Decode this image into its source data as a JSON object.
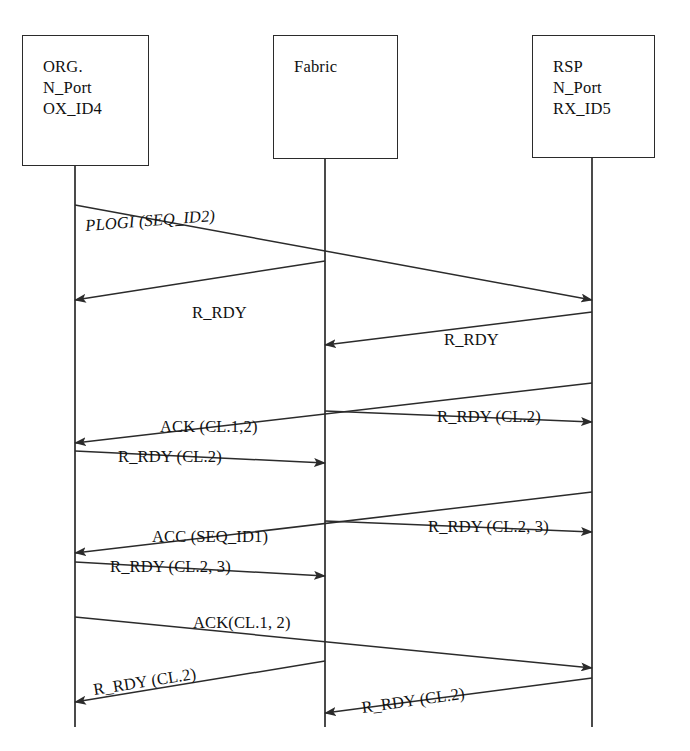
{
  "diagram": {
    "type": "sequence-diagram",
    "width": 690,
    "height": 751,
    "line_color": "#2b2b2b",
    "background_color": "#ffffff"
  },
  "nodes": [
    {
      "id": "org",
      "label": "ORG.\nN_Port\nOX_ID4",
      "lines": [
        "ORG.",
        "N_Port",
        "OX_ID4"
      ],
      "box": {
        "x": 22,
        "y": 35,
        "w": 127,
        "h": 131
      },
      "lifeline_x": 75,
      "lifeline_y1": 166,
      "lifeline_y2": 727
    },
    {
      "id": "fabric",
      "label": "Fabric",
      "lines": [
        "Fabric"
      ],
      "box": {
        "x": 273,
        "y": 35,
        "w": 125,
        "h": 124
      },
      "lifeline_x": 325,
      "lifeline_y1": 159,
      "lifeline_y2": 727
    },
    {
      "id": "rsp",
      "label": "RSP\nN_Port\nRX_ID5",
      "lines": [
        "RSP",
        "N_Port",
        "RX_ID5"
      ],
      "box": {
        "x": 532,
        "y": 35,
        "w": 123,
        "h": 123
      },
      "lifeline_x": 592,
      "lifeline_y1": 158,
      "lifeline_y2": 727
    }
  ],
  "messages": [
    {
      "id": "m1",
      "label": "PLOGI (SEQ_ID2)",
      "italic": true,
      "from": "org",
      "to": "rsp",
      "x1": 75,
      "y1": 205,
      "x2": 592,
      "y2": 300,
      "label_x": 86,
      "label_y": 216,
      "label_rot": -4.5
    },
    {
      "id": "m2",
      "label": "R_RDY",
      "italic": false,
      "from": "fabric",
      "to": "org",
      "x1": 325,
      "y1": 261,
      "x2": 75,
      "y2": 300,
      "label_x": 192,
      "label_y": 303,
      "label_rot": 0
    },
    {
      "id": "m3",
      "label": "R_RDY",
      "italic": false,
      "from": "rsp",
      "to": "fabric",
      "x1": 592,
      "y1": 312,
      "x2": 325,
      "y2": 345,
      "label_x": 444,
      "label_y": 330,
      "label_rot": 0
    },
    {
      "id": "m4",
      "label": "ACK (CL.1,2)",
      "italic": false,
      "from": "rsp",
      "to": "org",
      "x1": 592,
      "y1": 383,
      "x2": 75,
      "y2": 443,
      "label_x": 160,
      "label_y": 417,
      "label_rot": 0
    },
    {
      "id": "m5",
      "label": "R_RDY (CL.2)",
      "italic": false,
      "from": "fabric",
      "to": "rsp",
      "x1": 325,
      "y1": 411,
      "x2": 592,
      "y2": 422,
      "label_x": 437,
      "label_y": 407,
      "label_rot": 0
    },
    {
      "id": "m6",
      "label": "R_RDY (CL.2)",
      "italic": false,
      "from": "org",
      "to": "fabric",
      "x1": 75,
      "y1": 451,
      "x2": 325,
      "y2": 463,
      "label_x": 118,
      "label_y": 447,
      "label_rot": 0
    },
    {
      "id": "m7",
      "label": "ACC (SEQ_ID1)",
      "italic": false,
      "from": "rsp",
      "to": "org",
      "x1": 592,
      "y1": 492,
      "x2": 75,
      "y2": 553,
      "label_x": 152,
      "label_y": 527,
      "label_rot": 0
    },
    {
      "id": "m8",
      "label": "R_RDY (CL.2, 3)",
      "italic": false,
      "from": "fabric",
      "to": "rsp",
      "x1": 325,
      "y1": 521,
      "x2": 592,
      "y2": 532,
      "label_x": 428,
      "label_y": 517,
      "label_rot": 0
    },
    {
      "id": "m9",
      "label": "R_RDY (CL.2, 3)",
      "italic": false,
      "from": "org",
      "to": "fabric",
      "x1": 75,
      "y1": 562,
      "x2": 325,
      "y2": 576,
      "label_x": 110,
      "label_y": 557,
      "label_rot": 0
    },
    {
      "id": "m10",
      "label": "ACK(CL.1, 2)",
      "italic": false,
      "from": "org",
      "to": "rsp",
      "x1": 75,
      "y1": 617,
      "x2": 592,
      "y2": 668,
      "label_x": 193,
      "label_y": 613,
      "label_rot": 0
    },
    {
      "id": "m11",
      "label": "R_RDY (CL.2)",
      "italic": false,
      "from": "fabric",
      "to": "org",
      "x1": 325,
      "y1": 661,
      "x2": 75,
      "y2": 702,
      "label_x": 95,
      "label_y": 680,
      "label_rot": -9
    },
    {
      "id": "m12",
      "label": "R_RDY (CL.2)",
      "italic": false,
      "from": "rsp",
      "to": "fabric",
      "x1": 592,
      "y1": 678,
      "x2": 325,
      "y2": 713,
      "label_x": 363,
      "label_y": 698,
      "label_rot": -8
    }
  ]
}
